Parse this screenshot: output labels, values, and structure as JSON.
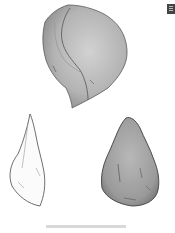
{
  "figure": {
    "items": [
      {
        "name": "rounded-stone",
        "fill": "#b9b9b9",
        "shade": "#8f8f8f"
      },
      {
        "name": "outline-flake",
        "fill": "#ffffff",
        "stroke": "#555555"
      },
      {
        "name": "pointed-stone",
        "fill": "#a9a9a9",
        "shade": "#7d7d7d"
      }
    ],
    "caption": ""
  },
  "corner_icon": "document-icon"
}
